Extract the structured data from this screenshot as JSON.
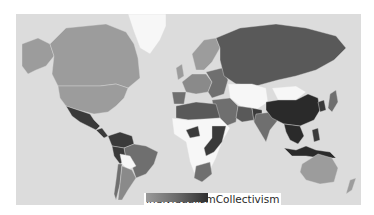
{
  "legend": {
    "low_label": "Individualism",
    "high_label": "Collectivism",
    "gradient": [
      "#9a9a9a",
      "#6a6a6a",
      "#2e2e2e"
    ]
  },
  "colors": {
    "ocean": "#dcdcdc",
    "no_data": "#f7f7f7",
    "individualist": "#9c9c9c",
    "mid_light": "#8a8a8a",
    "mid": "#6f6f6f",
    "mid_dark": "#595959",
    "collectivist": "#3a3a3a",
    "very_collectivist": "#2a2a2a"
  },
  "regions": [
    {
      "name": "canada",
      "shade": "individualist"
    },
    {
      "name": "usa",
      "shade": "individualist"
    },
    {
      "name": "alaska",
      "shade": "individualist"
    },
    {
      "name": "greenland",
      "shade": "no_data"
    },
    {
      "name": "mexico",
      "shade": "collectivist"
    },
    {
      "name": "central-america",
      "shade": "collectivist"
    },
    {
      "name": "colombia-venezuela",
      "shade": "collectivist"
    },
    {
      "name": "brazil",
      "shade": "mid"
    },
    {
      "name": "peru",
      "shade": "collectivist"
    },
    {
      "name": "bolivia",
      "shade": "no_data"
    },
    {
      "name": "chile",
      "shade": "mid"
    },
    {
      "name": "argentina",
      "shade": "mid_light"
    },
    {
      "name": "scandinavia",
      "shade": "individualist"
    },
    {
      "name": "uk",
      "shade": "individualist"
    },
    {
      "name": "western-europe",
      "shade": "mid_light"
    },
    {
      "name": "iberia",
      "shade": "mid"
    },
    {
      "name": "eastern-europe",
      "shade": "mid"
    },
    {
      "name": "russia",
      "shade": "mid_dark"
    },
    {
      "name": "kazakhstan",
      "shade": "no_data"
    },
    {
      "name": "mongolia",
      "shade": "no_data"
    },
    {
      "name": "middle-east",
      "shade": "mid"
    },
    {
      "name": "iran",
      "shade": "mid_dark"
    },
    {
      "name": "pakistan",
      "shade": "collectivist"
    },
    {
      "name": "india",
      "shade": "mid"
    },
    {
      "name": "china",
      "shade": "very_collectivist"
    },
    {
      "name": "korea",
      "shade": "collectivist"
    },
    {
      "name": "japan",
      "shade": "mid"
    },
    {
      "name": "southeast-asia",
      "shade": "very_collectivist"
    },
    {
      "name": "indonesia",
      "shade": "very_collectivist"
    },
    {
      "name": "philippines",
      "shade": "collectivist"
    },
    {
      "name": "north-africa",
      "shade": "mid_dark"
    },
    {
      "name": "sub-saharan-africa",
      "shade": "no_data"
    },
    {
      "name": "west-africa",
      "shade": "collectivist"
    },
    {
      "name": "east-africa",
      "shade": "collectivist"
    },
    {
      "name": "south-africa",
      "shade": "mid"
    },
    {
      "name": "australia",
      "shade": "individualist"
    },
    {
      "name": "new-zealand",
      "shade": "individualist"
    }
  ]
}
